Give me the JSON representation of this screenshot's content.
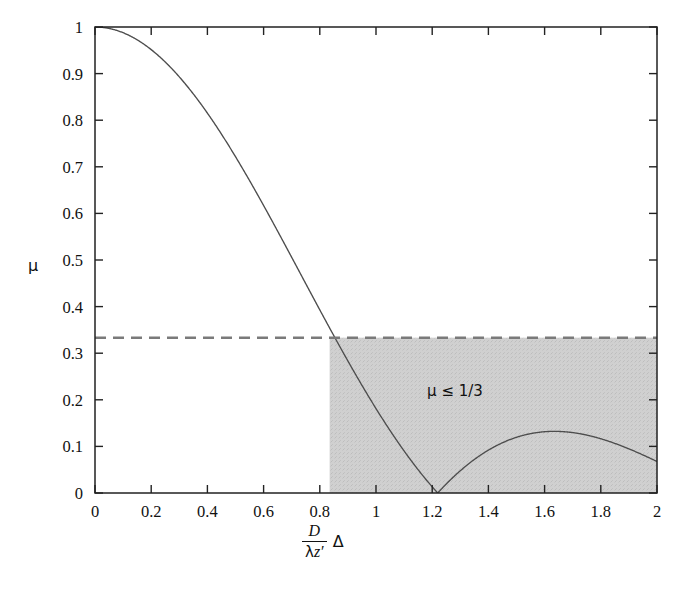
{
  "figure": {
    "y_axis_name": "μ",
    "x_axis_name_parts": {
      "numerator": "D",
      "denominator_lambda": "λ",
      "denominator_z": "z′",
      "trailing": "Δ"
    },
    "x_axis_name_plain": "(D / λz′) Δ",
    "annotation": "μ ≤ 1/3",
    "threshold_label": "1/3"
  },
  "chart_data": {
    "type": "line",
    "title": "",
    "xlabel": "(D/λz′)Δ",
    "ylabel": "μ",
    "xlim": [
      0,
      2
    ],
    "ylim": [
      0,
      1
    ],
    "grid": false,
    "legend": "none",
    "xticks": [
      0,
      0.2,
      0.4,
      0.6,
      0.8,
      1,
      1.2,
      1.4,
      1.6,
      1.8,
      2
    ],
    "xticklabels": [
      "0",
      "0.2",
      "0.4",
      "0.6",
      "0.8",
      "1",
      "1.2",
      "1.4",
      "1.6",
      "1.8",
      "2"
    ],
    "yticks": [
      0,
      0.1,
      0.2,
      0.3,
      0.4,
      0.5,
      0.6,
      0.7,
      0.8,
      0.9,
      1
    ],
    "yticklabels": [
      "0",
      "0.1",
      "0.2",
      "0.3",
      "0.4",
      "0.5",
      "0.6",
      "0.7",
      "0.8",
      "0.9",
      "1"
    ],
    "series": [
      {
        "name": "|2J1(πx)/(πx)|",
        "style": "solid",
        "color": "#4d4d4d",
        "x": [
          0,
          0.05,
          0.1,
          0.15,
          0.2,
          0.25,
          0.3,
          0.35,
          0.4,
          0.45,
          0.5,
          0.55,
          0.6,
          0.65,
          0.7,
          0.75,
          0.8,
          0.835,
          0.85,
          0.9,
          0.95,
          1,
          1.05,
          1.1,
          1.15,
          1.2,
          1.2197,
          1.25,
          1.3,
          1.35,
          1.4,
          1.45,
          1.5,
          1.55,
          1.6,
          1.635,
          1.65,
          1.7,
          1.75,
          1.8,
          1.85,
          1.9,
          1.95,
          2
        ],
        "y": [
          1,
          0.997,
          0.99,
          0.977,
          0.96,
          0.939,
          0.913,
          0.883,
          0.85,
          0.813,
          0.774,
          0.732,
          0.688,
          0.642,
          0.595,
          0.546,
          0.497,
          0.463,
          0.448,
          0.399,
          0.35,
          0.302,
          0.255,
          0.209,
          0.165,
          0.123,
          0,
          0.034,
          0.06,
          0.082,
          0.1,
          0.114,
          0.124,
          0.13,
          0.133,
          0.133,
          0.132,
          0.129,
          0.123,
          0.116,
          0.107,
          0.098,
          0.088,
          0.077
        ]
      },
      {
        "name": "threshold μ = 1/3",
        "style": "dashed",
        "color": "#7a7a7a",
        "x": [
          0,
          2
        ],
        "y": [
          0.3333,
          0.3333
        ]
      }
    ],
    "shaded_region": {
      "label": "μ ≤ 1/3",
      "color": "#cfcfcf",
      "x_start": 0.835,
      "x_end": 2,
      "y_start": 0,
      "y_end": 0.3333
    }
  }
}
